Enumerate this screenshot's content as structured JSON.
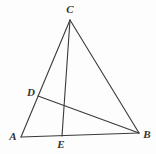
{
  "figure": {
    "width": 156,
    "height": 154,
    "background_color": "#fdfdfd",
    "line_color": "#3a3a3a",
    "label_color": "#333333",
    "stroke_width": 1.1
  },
  "labels": {
    "a": "A",
    "b": "B",
    "c": "C",
    "d": "D",
    "e": "E"
  },
  "points": {
    "A": {
      "x": 21,
      "y": 137
    },
    "B": {
      "x": 139,
      "y": 133
    },
    "C": {
      "x": 70,
      "y": 20
    },
    "D": {
      "x": 38,
      "y": 96
    },
    "E": {
      "x": 62,
      "y": 136
    },
    "intersection": {
      "x": 66,
      "y": 107
    }
  },
  "label_positions": {
    "A": {
      "x": 13,
      "y": 136
    },
    "B": {
      "x": 147,
      "y": 134
    },
    "C": {
      "x": 70,
      "y": 9
    },
    "D": {
      "x": 31,
      "y": 92
    },
    "E": {
      "x": 61,
      "y": 144
    }
  },
  "segments": [
    {
      "name": "side-ab",
      "from": "A",
      "to": "B"
    },
    {
      "name": "side-ac",
      "from": "A",
      "to": "C"
    },
    {
      "name": "side-cb",
      "from": "C",
      "to": "B"
    },
    {
      "name": "cevian-ce",
      "from": "C",
      "to": "E"
    },
    {
      "name": "cevian-db",
      "from": "D",
      "to": "B"
    }
  ]
}
